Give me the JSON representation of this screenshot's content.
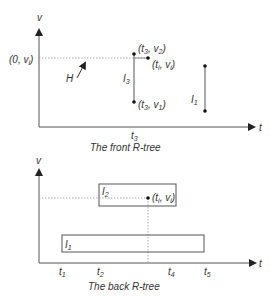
{
  "front": {
    "caption": "The front R-tree",
    "y_axis_label": "v",
    "x_axis_label": "t",
    "origin_point_label": "(0, v",
    "origin_point_sub": "i",
    "vector_label": "H",
    "segment_I3_label": "I",
    "segment_I3_sub": "3",
    "segment_I1_label": "I",
    "segment_I1_sub": "1",
    "top_point_label": "(t",
    "top_point_t_sub": "3",
    "top_point_v": ", v",
    "top_point_v_sub": "2",
    "query_point_label": "(t",
    "query_point_t_sub": "i",
    "query_point_v": ", v",
    "query_point_v_sub": "i",
    "bottom_point_label": "(t",
    "bottom_point_t_sub": "3",
    "bottom_point_v": ", v",
    "bottom_point_v_sub": "1",
    "tick_label": "t",
    "tick_sub": "3"
  },
  "back": {
    "caption": "The back R-tree",
    "y_axis_label": "v",
    "x_axis_label": "t",
    "box_I2_label": "I",
    "box_I2_sub": "2",
    "box_I1_label": "I",
    "box_I1_sub": "1",
    "query_point_label": "(t",
    "query_point_t_sub": "i",
    "query_point_v": ", v",
    "query_point_v_sub": "i",
    "ticks": [
      {
        "label": "t",
        "sub": "1"
      },
      {
        "label": "t",
        "sub": "2"
      },
      {
        "label": "t",
        "sub": "4"
      },
      {
        "label": "t",
        "sub": "5"
      }
    ]
  },
  "colors": {
    "line": "#555555",
    "dotted": "#888888",
    "text": "#333333"
  }
}
